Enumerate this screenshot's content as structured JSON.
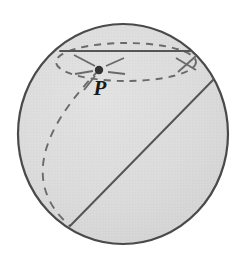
{
  "figure": {
    "type": "geometry-diagram",
    "canvas": {
      "width": 241,
      "height": 275,
      "background": "#ffffff"
    },
    "colors": {
      "sphere_fill": "#dcdcdc",
      "sphere_fill_shade": "#d4d4d4",
      "outline": "#4a4a4a",
      "solid_line": "#555555",
      "dashed_line": "#6a6a6a",
      "point_marker": "#333333",
      "label_text": "#1a1a1a"
    },
    "sphere": {
      "name": "sphere-outline",
      "center_x": 123,
      "center_y": 134,
      "radius_x": 105,
      "radius_y": 110,
      "stroke_width": 2.2
    },
    "point": {
      "label": "P",
      "marker_name": "point-p-marker",
      "x": 99,
      "y": 70,
      "marker_radius": 4.2,
      "label_x": 100,
      "label_y": 95
    },
    "chord": {
      "name": "top-chord-line",
      "x1": 60,
      "y1": 51,
      "x2": 193,
      "y2": 51,
      "stroke_width": 2.0,
      "style": "solid"
    },
    "diagonal": {
      "name": "diagonal-great-circle-line",
      "x1": 70,
      "y1": 226,
      "x2": 214,
      "y2": 79,
      "stroke_width": 2.0,
      "style": "solid"
    },
    "dashed_ellipse": {
      "name": "dashed-horizontal-circle",
      "description": "small circle through P seen in perspective, hanging below the top chord",
      "center_x": 126,
      "center_y": 62,
      "radius_x": 70,
      "radius_y": 19,
      "dash": "7 6",
      "stroke_width": 1.9
    },
    "dashed_arc_left": {
      "name": "dashed-meridian-arc",
      "description": "large dashed arc from P bulging left and down to the lower-left circle edge",
      "start_x": 99,
      "start_y": 70,
      "end_x": 70,
      "end_y": 226,
      "bulge_x": 44,
      "bulge_y": 158,
      "dash": "8 7",
      "stroke_width": 1.9
    },
    "radial_dashes": [
      {
        "name": "dash-spoke-up-left",
        "x1": 95,
        "y1": 66,
        "x2": 74,
        "y2": 55
      },
      {
        "name": "dash-spoke-left",
        "x1": 93,
        "y1": 71,
        "x2": 75,
        "y2": 74
      },
      {
        "name": "dash-spoke-down-left",
        "x1": 95,
        "y1": 76,
        "x2": 84,
        "y2": 90
      },
      {
        "name": "dash-spoke-right",
        "x1": 108,
        "y1": 72,
        "x2": 125,
        "y2": 74
      },
      {
        "name": "dash-spoke-up-right",
        "x1": 106,
        "y1": 66,
        "x2": 124,
        "y2": 58
      }
    ],
    "right_crossing_dashes": [
      {
        "name": "dash-right-upper",
        "x1": 176,
        "y1": 58,
        "x2": 196,
        "y2": 70
      },
      {
        "name": "dash-right-lower",
        "x1": 196,
        "y1": 56,
        "x2": 178,
        "y2": 72
      }
    ]
  }
}
